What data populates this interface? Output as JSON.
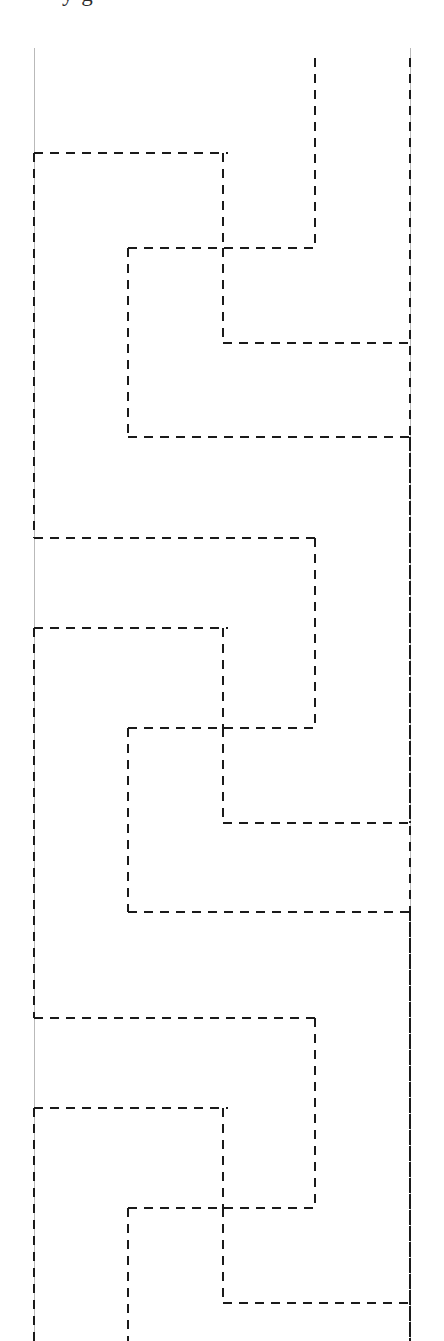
{
  "figure": {
    "background_color": "#ffffff",
    "width": 444,
    "height": 1341,
    "clipped_caption": "y   g",
    "stroke": {
      "dashed_color": "#1a1a1a",
      "dashed_width": 2.6,
      "dash_pattern": "9 7",
      "guide_color": "#b9b9b9",
      "guide_width": 1.0
    },
    "grid": {
      "x_positions": [
        34,
        128,
        223,
        315,
        410
      ],
      "x_labels": [
        "x0",
        "x1",
        "x2",
        "x3",
        "x4"
      ],
      "block_period": 480,
      "block_anchors": [
        153,
        538,
        1018
      ],
      "row_offsets": [
        0,
        95,
        190,
        284
      ],
      "row_labels": [
        "r0",
        "r1",
        "r2",
        "r3"
      ]
    },
    "guide_lines": [
      {
        "name": "left-guide",
        "x": 34,
        "y1": 48,
        "y2": 1341
      },
      {
        "name": "right-guide",
        "x": 410,
        "y1": 48,
        "y2": 1341
      }
    ],
    "meander_blocks": [
      {
        "name": "meander-block-1",
        "segments": [
          {
            "type": "h",
            "y": 153,
            "x1": 34,
            "x2": 228
          },
          {
            "type": "v",
            "x": 223,
            "y1": 153,
            "y2": 248
          },
          {
            "type": "h",
            "y": 248,
            "x1": 128,
            "x2": 315
          },
          {
            "type": "v",
            "x": 128,
            "y1": 248,
            "y2": 437
          },
          {
            "type": "v",
            "x": 315,
            "y1": 58,
            "y2": 248
          },
          {
            "type": "v",
            "x": 223,
            "y1": 248,
            "y2": 343
          },
          {
            "type": "h",
            "y": 343,
            "x1": 223,
            "x2": 412
          },
          {
            "type": "h",
            "y": 437,
            "x1": 128,
            "x2": 412
          },
          {
            "type": "v",
            "x": 34,
            "y1": 153,
            "y2": 538
          }
        ]
      },
      {
        "name": "meander-block-2",
        "segments": [
          {
            "type": "h",
            "y": 538,
            "x1": 34,
            "x2": 317
          },
          {
            "type": "v",
            "x": 315,
            "y1": 538,
            "y2": 728
          },
          {
            "type": "h",
            "y": 628,
            "x1": 34,
            "x2": 228
          },
          {
            "type": "v",
            "x": 223,
            "y1": 628,
            "y2": 728
          },
          {
            "type": "h",
            "y": 728,
            "x1": 128,
            "x2": 315
          },
          {
            "type": "v",
            "x": 128,
            "y1": 728,
            "y2": 912
          },
          {
            "type": "v",
            "x": 223,
            "y1": 728,
            "y2": 823
          },
          {
            "type": "h",
            "y": 823,
            "x1": 223,
            "x2": 412
          },
          {
            "type": "h",
            "y": 912,
            "x1": 128,
            "x2": 412
          },
          {
            "type": "v",
            "x": 34,
            "y1": 628,
            "y2": 1018
          },
          {
            "type": "v",
            "x": 410,
            "y1": 437,
            "y2": 823
          },
          {
            "type": "v",
            "x": 410,
            "y1": 912,
            "y2": 1341
          }
        ]
      },
      {
        "name": "meander-block-3",
        "segments": [
          {
            "type": "h",
            "y": 1018,
            "x1": 34,
            "x2": 317
          },
          {
            "type": "v",
            "x": 315,
            "y1": 1018,
            "y2": 1208
          },
          {
            "type": "h",
            "y": 1108,
            "x1": 34,
            "x2": 228
          },
          {
            "type": "v",
            "x": 223,
            "y1": 1108,
            "y2": 1208
          },
          {
            "type": "h",
            "y": 1208,
            "x1": 128,
            "x2": 315
          },
          {
            "type": "v",
            "x": 128,
            "y1": 1208,
            "y2": 1341
          },
          {
            "type": "v",
            "x": 223,
            "y1": 1208,
            "y2": 1303
          },
          {
            "type": "h",
            "y": 1303,
            "x1": 223,
            "x2": 412
          },
          {
            "type": "v",
            "x": 34,
            "y1": 1108,
            "y2": 1341
          }
        ]
      }
    ],
    "long_verticals": [
      {
        "name": "far-right-dashed",
        "x": 410,
        "y1": 58,
        "y2": 1341
      },
      {
        "name": "inner-right-dashed-top",
        "x": 315,
        "y1": 58,
        "y2": 248
      }
    ]
  }
}
